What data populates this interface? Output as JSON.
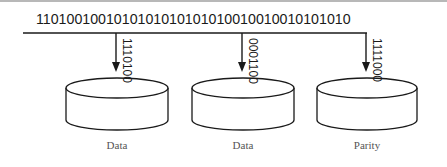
{
  "diagram": {
    "type": "raid-striping-with-parity",
    "input_stream": "1101001001010101010101010010010010101010",
    "colors": {
      "stroke": "#1a1a1a",
      "caption": "#555555",
      "border": "#b8b8b8"
    },
    "disks": [
      {
        "label": "Data",
        "bits": "1110100"
      },
      {
        "label": "Data",
        "bits": "0001100"
      },
      {
        "label": "Parity",
        "bits": "1111000"
      }
    ]
  }
}
